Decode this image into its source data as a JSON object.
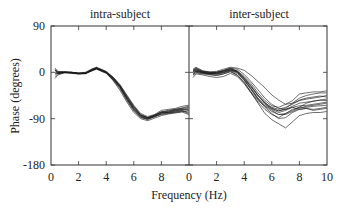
{
  "chart_data": {
    "type": "line",
    "ylabel": "Phase (degrees)",
    "xlabel": "Frequency (Hz)",
    "ylim": [
      -180,
      90
    ],
    "xlim": [
      0,
      10
    ],
    "yticks": [
      90,
      0,
      -90,
      -180
    ],
    "ytick_labels": [
      "90",
      "0",
      "-90",
      "-180"
    ],
    "xtick_labels_left": [
      "0",
      "2",
      "4",
      "6",
      "8"
    ],
    "xtick_labels_right": [
      "0",
      "2",
      "4",
      "6",
      "8",
      "10"
    ],
    "grid": false,
    "panels": [
      {
        "title": "intra-subject",
        "x": [
          0.3,
          0.5,
          1,
          1.5,
          2,
          2.5,
          3,
          3.3,
          4,
          4.5,
          5,
          5.5,
          6,
          6.5,
          7,
          7.5,
          8,
          8.5,
          9,
          9.5,
          10
        ],
        "series": [
          {
            "name": "s1",
            "values": [
              5,
              -2,
              0,
              -1,
              -3,
              -2,
              5,
              8,
              0,
              -12,
              -28,
              -50,
              -70,
              -85,
              -90,
              -83,
              -78,
              -75,
              -72,
              -70,
              -68
            ]
          },
          {
            "name": "s2",
            "values": [
              -8,
              -3,
              0,
              -1,
              -2,
              -1,
              6,
              9,
              1,
              -10,
              -25,
              -46,
              -66,
              -82,
              -88,
              -84,
              -76,
              -78,
              -75,
              -72,
              -70
            ]
          },
          {
            "name": "s3",
            "values": [
              3,
              0,
              1,
              0,
              -2,
              -3,
              4,
              7,
              -1,
              -14,
              -30,
              -53,
              -73,
              -87,
              -92,
              -86,
              -80,
              -77,
              -74,
              -73,
              -72
            ]
          },
          {
            "name": "s4",
            "values": [
              -12,
              -5,
              -1,
              -2,
              -3,
              -2,
              3,
              6,
              -2,
              -15,
              -32,
              -55,
              -75,
              -88,
              -91,
              -85,
              -82,
              -80,
              -78,
              -76,
              -75
            ]
          },
          {
            "name": "s5",
            "values": [
              8,
              2,
              1,
              0,
              -1,
              0,
              7,
              10,
              2,
              -9,
              -24,
              -44,
              -64,
              -80,
              -86,
              -82,
              -74,
              -72,
              -70,
              -66,
              -64
            ]
          },
          {
            "name": "s6",
            "values": [
              0,
              -1,
              0,
              -1,
              -2,
              -2,
              5,
              8,
              0,
              -12,
              -28,
              -50,
              -70,
              -84,
              -89,
              -84,
              -78,
              -78,
              -76,
              -74,
              -78
            ]
          },
          {
            "name": "s7",
            "values": [
              -4,
              -2,
              0,
              0,
              -2,
              -1,
              4,
              7,
              -1,
              -11,
              -27,
              -49,
              -68,
              -83,
              -88,
              -85,
              -79,
              -76,
              -73,
              -71,
              -74
            ]
          },
          {
            "name": "s8",
            "values": [
              4,
              1,
              0,
              -1,
              -3,
              -2,
              5,
              9,
              1,
              -13,
              -29,
              -52,
              -72,
              -86,
              -90,
              -87,
              -81,
              -79,
              -77,
              -75,
              -80
            ]
          },
          {
            "name": "s9",
            "values": [
              -2,
              -2,
              -1,
              -1,
              -2,
              -1,
              6,
              8,
              0,
              -10,
              -26,
              -47,
              -67,
              -83,
              -88,
              -83,
              -77,
              -74,
              -72,
              -69,
              -66
            ]
          },
          {
            "name": "s10",
            "values": [
              6,
              0,
              0,
              0,
              -2,
              -2,
              4,
              7,
              -1,
              -16,
              -35,
              -58,
              -78,
              -90,
              -94,
              -89,
              -84,
              -81,
              -79,
              -77,
              -82
            ]
          }
        ]
      },
      {
        "title": "inter-subject",
        "x": [
          0.3,
          0.5,
          1,
          1.5,
          2,
          2.5,
          3,
          3.5,
          4,
          4.5,
          5,
          5.5,
          6,
          6.5,
          7,
          7.5,
          8,
          8.5,
          9,
          9.5,
          10
        ],
        "series": [
          {
            "name": "s1",
            "values": [
              5,
              8,
              2,
              0,
              -2,
              2,
              6,
              3,
              -8,
              -22,
              -40,
              -55,
              -65,
              -68,
              -62,
              -55,
              -42,
              -40,
              -38,
              -38,
              -36
            ]
          },
          {
            "name": "s2",
            "values": [
              -5,
              0,
              -2,
              -3,
              0,
              4,
              8,
              2,
              -12,
              -28,
              -45,
              -58,
              -70,
              -75,
              -70,
              -60,
              -55,
              -52,
              -50,
              -48,
              -45
            ]
          },
          {
            "name": "s3",
            "values": [
              0,
              3,
              0,
              -4,
              -6,
              -3,
              2,
              -5,
              -20,
              -38,
              -55,
              -65,
              -72,
              -78,
              -74,
              -68,
              -65,
              -64,
              -62,
              -60,
              -58
            ]
          },
          {
            "name": "s4",
            "values": [
              -10,
              -3,
              -5,
              -8,
              -10,
              -8,
              -2,
              -8,
              -22,
              -40,
              -58,
              -72,
              -82,
              -88,
              -80,
              -72,
              -68,
              -68,
              -66,
              -65,
              -64
            ]
          },
          {
            "name": "s5",
            "values": [
              2,
              5,
              0,
              -2,
              -2,
              0,
              4,
              0,
              -15,
              -32,
              -50,
              -62,
              -70,
              -75,
              -72,
              -68,
              -72,
              -70,
              -72,
              -70,
              -68
            ]
          },
          {
            "name": "s6",
            "values": [
              6,
              10,
              3,
              1,
              2,
              6,
              10,
              8,
              4,
              -6,
              -18,
              -30,
              -44,
              -54,
              -62,
              -60,
              -50,
              -45,
              -42,
              -40,
              -40
            ]
          },
          {
            "name": "s7",
            "values": [
              -3,
              2,
              -1,
              -2,
              -1,
              2,
              5,
              0,
              -14,
              -32,
              -52,
              -68,
              -80,
              -90,
              -88,
              -78,
              -72,
              -70,
              -74,
              -72,
              -70
            ]
          },
          {
            "name": "s8",
            "values": [
              3,
              6,
              1,
              -1,
              0,
              3,
              7,
              2,
              -10,
              -26,
              -44,
              -60,
              -74,
              -82,
              -82,
              -76,
              -70,
              -66,
              -64,
              -62,
              -60
            ]
          },
          {
            "name": "s9",
            "values": [
              -6,
              -1,
              -3,
              -5,
              -6,
              -3,
              1,
              -6,
              -20,
              -40,
              -60,
              -80,
              -92,
              -100,
              -108,
              -96,
              -84,
              -80,
              -78,
              -78,
              -76
            ]
          },
          {
            "name": "s10",
            "values": [
              1,
              4,
              0,
              -2,
              -3,
              0,
              5,
              1,
              -12,
              -28,
              -46,
              -60,
              -68,
              -72,
              -68,
              -62,
              -54,
              -50,
              -48,
              -46,
              -48
            ]
          },
          {
            "name": "s11",
            "values": [
              -2,
              2,
              -1,
              -3,
              -4,
              -1,
              3,
              -2,
              -16,
              -34,
              -52,
              -66,
              -76,
              -82,
              -80,
              -74,
              -68,
              -60,
              -56,
              -54,
              -52
            ]
          },
          {
            "name": "s12",
            "values": [
              4,
              7,
              2,
              0,
              0,
              3,
              8,
              6,
              -4,
              -18,
              -34,
              -50,
              -62,
              -70,
              -72,
              -66,
              -60,
              -58,
              -56,
              -54,
              -55
            ]
          }
        ]
      }
    ]
  },
  "figure": {
    "ylabel": "Phase (degrees)",
    "xlabel": "Frequency (Hz)",
    "left_title": "intra-subject",
    "right_title": "inter-subject"
  }
}
